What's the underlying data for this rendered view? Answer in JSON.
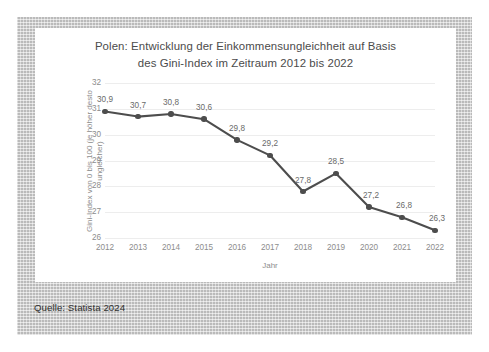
{
  "page": {
    "source_note": "Quelle: Statista 2024",
    "frame_color": "#c9c9c9",
    "card_color": "#ffffff"
  },
  "chart_data": {
    "type": "line",
    "title": "Polen: Entwicklung der Einkommensungleichheit auf Basis des Gini-Index im Zeitraum 2012 bis 2022",
    "title_line1": "Polen: Entwicklung der Einkommensungleichheit auf Basis",
    "title_line2": "des Gini-Index im Zeitraum 2012 bis 2022",
    "xlabel": "Jahr",
    "ylabel": "Gini-Index von 0 bis 100 (je höher desto ungleicher)",
    "ylabel_line1": "Gini-Index von 0 bis 100 (je höher desto",
    "ylabel_line2": "ungleicher)",
    "categories": [
      "2012",
      "2013",
      "2014",
      "2015",
      "2016",
      "2017",
      "2018",
      "2019",
      "2020",
      "2021",
      "2022"
    ],
    "values": [
      30.9,
      30.7,
      30.8,
      30.6,
      29.8,
      29.2,
      27.8,
      28.5,
      27.2,
      26.8,
      26.3
    ],
    "point_labels": [
      "30,9",
      "30,7",
      "30,8",
      "30,6",
      "29,8",
      "29,2",
      "27,8",
      "28,5",
      "27,2",
      "26,8",
      "26,3"
    ],
    "ylim": [
      26,
      32
    ],
    "yticks": [
      32,
      31,
      30,
      29,
      28,
      27,
      26
    ],
    "ytick_labels": [
      "32",
      "31",
      "30",
      "29",
      "28",
      "27",
      "26"
    ],
    "grid": true,
    "legend": "none",
    "series_color": "#4d4d4d",
    "grid_color": "#ededed",
    "tick_text_color": "#8d8d8d"
  }
}
